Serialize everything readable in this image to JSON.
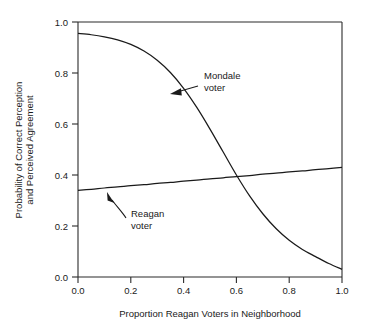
{
  "chart_data": {
    "type": "line",
    "title": "",
    "xlabel": "Proportion Reagan Voters in Neighborhood",
    "ylabel": "Probability of Correct Perception and Perceived Agreement",
    "ylabel_line1": "Probability of Correct Perception",
    "ylabel_line2": "and Perceived Agreement",
    "xlim": [
      0.0,
      1.0
    ],
    "ylim": [
      0.0,
      1.0
    ],
    "grid": false,
    "legend_position": "inline-annotations",
    "xticks": [
      0.0,
      0.2,
      0.4,
      0.6,
      0.8,
      1.0
    ],
    "xtick_labels": [
      "0.0",
      "0.2",
      "0.4",
      "0.6",
      "0.8",
      "1.0"
    ],
    "yticks": [
      0.0,
      0.2,
      0.4,
      0.6,
      0.8,
      1.0
    ],
    "ytick_labels": [
      "0.0",
      "0.2",
      "0.4",
      "0.6",
      "0.8",
      "1.0"
    ],
    "x": [
      0.0,
      0.05,
      0.1,
      0.15,
      0.2,
      0.25,
      0.3,
      0.35,
      0.4,
      0.45,
      0.5,
      0.55,
      0.6,
      0.65,
      0.7,
      0.75,
      0.8,
      0.85,
      0.9,
      0.95,
      1.0
    ],
    "series": [
      {
        "name": "Mondale voter",
        "values": [
          0.955,
          0.95,
          0.942,
          0.93,
          0.912,
          0.886,
          0.85,
          0.802,
          0.74,
          0.665,
          0.58,
          0.49,
          0.4,
          0.318,
          0.248,
          0.19,
          0.144,
          0.108,
          0.08,
          0.053,
          0.03
        ]
      },
      {
        "name": "Reagan voter",
        "values": [
          0.34,
          0.344,
          0.349,
          0.353,
          0.358,
          0.362,
          0.367,
          0.371,
          0.376,
          0.38,
          0.385,
          0.389,
          0.394,
          0.398,
          0.403,
          0.407,
          0.412,
          0.416,
          0.421,
          0.425,
          0.43
        ]
      }
    ],
    "annotations": [
      {
        "id": "mondale",
        "label_line1": "Mondale",
        "label_line2": "voter",
        "target_x": 0.4,
        "target_y": 0.74
      },
      {
        "id": "reagan",
        "label_line1": "Reagan",
        "label_line2": "voter",
        "target_x": 0.12,
        "target_y": 0.35
      }
    ],
    "crossing_point": {
      "x": 0.53,
      "y": 0.383
    }
  }
}
